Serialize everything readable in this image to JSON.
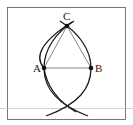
{
  "diagram": {
    "points": {
      "A": {
        "label": "A"
      },
      "B": {
        "label": "B"
      },
      "C": {
        "label": "C"
      }
    },
    "segments": [
      "AB",
      "AC",
      "BC"
    ],
    "arcs": [
      "circle centered A through B",
      "circle centered B through A"
    ],
    "colors": {
      "ink": "#1a1a1a",
      "thin_line": "#777777",
      "frame": "#555555",
      "rule": "#c8c8c8"
    }
  }
}
